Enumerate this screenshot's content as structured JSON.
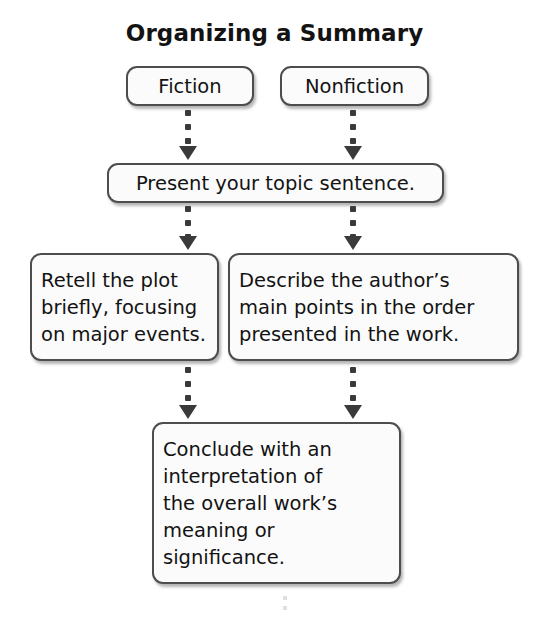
{
  "diagram": {
    "title": "Organizing a Summary",
    "type": "flowchart",
    "nodes": {
      "fiction": {
        "label": "Fiction"
      },
      "nonfiction": {
        "label": "Nonfiction"
      },
      "topic": {
        "label": "Present your topic sentence."
      },
      "retell": {
        "label": "Retell the plot\nbriefly, focusing\non major events."
      },
      "describe": {
        "label": "Describe the author’s\nmain points in the order\npresented in the work."
      },
      "conclude": {
        "label": "Conclude with an\ninterpretation of\nthe overall work’s\nmeaning or\nsignificance."
      }
    },
    "edges": [
      {
        "from": "fiction",
        "to": "topic",
        "style": "dotted-arrow"
      },
      {
        "from": "nonfiction",
        "to": "topic",
        "style": "dotted-arrow"
      },
      {
        "from": "topic",
        "to": "retell",
        "style": "dotted-arrow"
      },
      {
        "from": "topic",
        "to": "describe",
        "style": "dotted-arrow"
      },
      {
        "from": "retell",
        "to": "conclude",
        "style": "dotted-arrow"
      },
      {
        "from": "describe",
        "to": "conclude",
        "style": "dotted-arrow"
      }
    ],
    "colors": {
      "text": "#131313",
      "node_border": "#4d4d4d",
      "node_fill": "#fbfbfb",
      "connector": "#3a3a3a",
      "background": "#ffffff"
    }
  }
}
